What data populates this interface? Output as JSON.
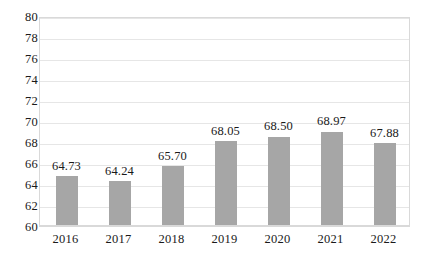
{
  "chart_data": {
    "type": "bar",
    "title": "",
    "subtitle": "",
    "xlabel": "",
    "ylabel": "",
    "categories": [
      "2016",
      "2017",
      "2018",
      "2019",
      "2020",
      "2021",
      "2022"
    ],
    "values": [
      64.73,
      64.24,
      65.7,
      68.05,
      68.5,
      68.97,
      67.88
    ],
    "data_labels": [
      "64.73",
      "64.24",
      "65.70",
      "68.05",
      "68.50",
      "68.97",
      "67.88"
    ],
    "ylim": [
      60,
      80
    ],
    "ytick_step": 2,
    "ytick_labels": [
      "80",
      "78",
      "76",
      "74",
      "72",
      "70",
      "68",
      "66",
      "64",
      "62",
      "60"
    ],
    "ytick_values": [
      80,
      78,
      76,
      74,
      72,
      70,
      68,
      66,
      64,
      62,
      60
    ],
    "grid": true,
    "legend": false,
    "legend_position": "none",
    "series": [
      {
        "name": "",
        "values": [
          64.73,
          64.24,
          65.7,
          68.05,
          68.5,
          68.97,
          67.88
        ],
        "color": "#a6a6a6"
      }
    ],
    "colors": {
      "bar": "#a6a6a6",
      "gridline": "#e6e6e6",
      "plot_border": "#d9d9d9",
      "text": "#1a1a1a",
      "background": "#ffffff"
    }
  }
}
